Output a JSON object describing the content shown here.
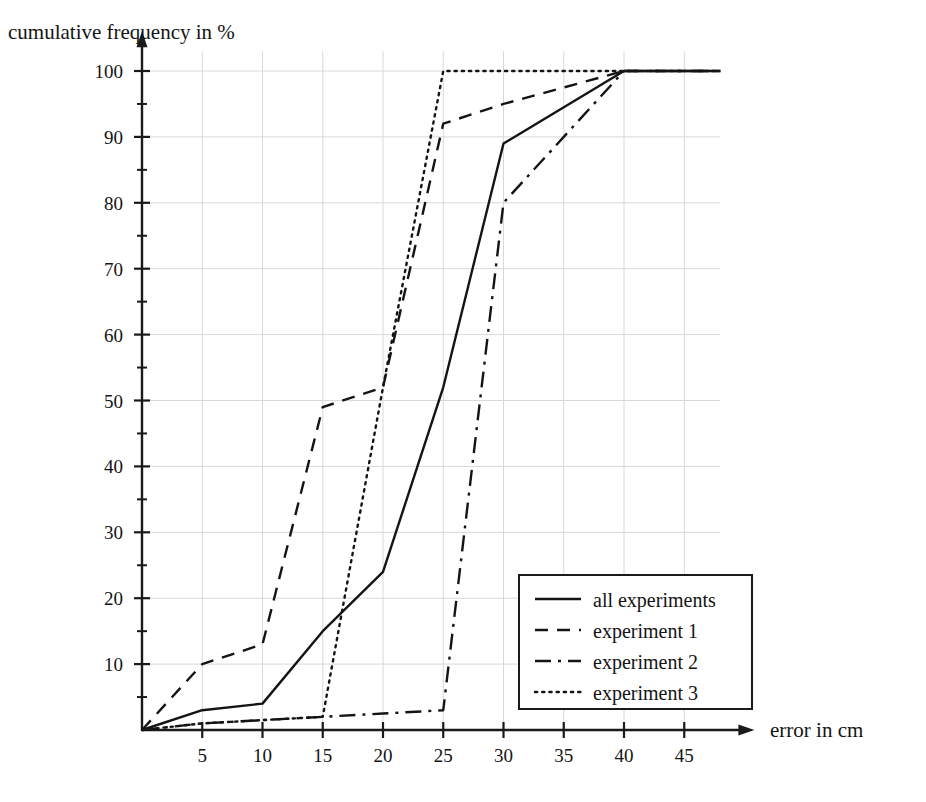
{
  "chart_data": {
    "type": "line",
    "title": "",
    "xlabel": "error in cm",
    "ylabel": "cumulative frequency in %",
    "xlim": [
      0,
      48
    ],
    "ylim": [
      0,
      103
    ],
    "grid": true,
    "legend_position": "bottom-right",
    "xticks": [
      5,
      10,
      15,
      20,
      25,
      30,
      35,
      40,
      45
    ],
    "xtick_labels": [
      "5",
      "10",
      "15",
      "20",
      "25",
      "30",
      "35",
      "40",
      "45"
    ],
    "xminor_ticks": [
      2.5,
      7.5,
      12.5,
      17.5,
      22.5,
      27.5,
      32.5,
      37.5,
      42.5,
      47.5
    ],
    "yticks": [
      10,
      20,
      30,
      40,
      50,
      60,
      70,
      80,
      90,
      100
    ],
    "ytick_labels": [
      "10",
      "20",
      "30",
      "40",
      "50",
      "60",
      "70",
      "80",
      "90",
      "100"
    ],
    "yminor_ticks": [
      5,
      15,
      25,
      35,
      45,
      55,
      65,
      75,
      85,
      95
    ],
    "series": [
      {
        "name": "all experiments",
        "dash": "solid",
        "color": "#141414",
        "width": 2.4,
        "x": [
          0,
          5,
          10,
          15,
          20,
          25,
          30,
          40,
          48
        ],
        "values": [
          0,
          3,
          4,
          15,
          24,
          52,
          89,
          100,
          100
        ]
      },
      {
        "name": "experiment 1",
        "dash": "dashed",
        "color": "#141414",
        "width": 2.4,
        "x": [
          0,
          5,
          10,
          15,
          20,
          25,
          30,
          40,
          48
        ],
        "values": [
          0,
          10,
          13,
          49,
          52,
          92,
          95,
          100,
          100
        ]
      },
      {
        "name": "experiment 2",
        "dash": "dashdot",
        "color": "#141414",
        "width": 2.4,
        "x": [
          0,
          5,
          10,
          15,
          20,
          25,
          30,
          40,
          48
        ],
        "values": [
          0,
          1,
          1.5,
          2,
          2.5,
          3,
          80,
          100,
          100
        ]
      },
      {
        "name": "experiment 3",
        "dash": "dotted",
        "color": "#141414",
        "width": 2.4,
        "x": [
          0,
          5,
          10,
          15,
          20,
          25,
          30,
          40,
          48
        ],
        "values": [
          0,
          1,
          1.5,
          2,
          52,
          100,
          100,
          100,
          100
        ]
      }
    ]
  },
  "legend": {
    "entries": [
      {
        "label": "all experiments",
        "dash": "solid"
      },
      {
        "label": "experiment 1",
        "dash": "dashed"
      },
      {
        "label": "experiment 2",
        "dash": "dashdot"
      },
      {
        "label": "experiment 3",
        "dash": "dotted"
      }
    ]
  },
  "axis_labels": {
    "y_caption": "cumulative frequency in %",
    "x_caption": "error in cm"
  }
}
